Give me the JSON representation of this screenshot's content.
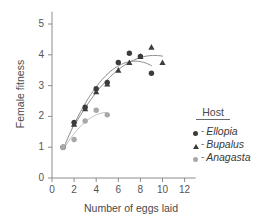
{
  "chart_data": {
    "type": "scatter",
    "title": "",
    "xlabel": "Number of eggs laid",
    "ylabel": "Female fitness",
    "xlim": [
      0,
      13
    ],
    "ylim": [
      0,
      5.4
    ],
    "xticks": [
      0,
      2,
      4,
      6,
      8,
      10,
      12
    ],
    "yticks": [
      0,
      1,
      2,
      3,
      4,
      5
    ],
    "grid": false,
    "legend_position": "right",
    "legend_title": "Host",
    "series": [
      {
        "name": "Ellopia",
        "marker": "circle",
        "color": "#3c3c3c",
        "dash": "-",
        "x": [
          1,
          2,
          3,
          4,
          5,
          6,
          7,
          8,
          9
        ],
        "y": [
          1.0,
          1.8,
          2.3,
          2.9,
          3.1,
          3.75,
          4.05,
          3.95,
          3.4
        ],
        "fit_curve": true
      },
      {
        "name": "Bupalus",
        "marker": "triangle",
        "color": "#3c3c3c",
        "dash": "-",
        "x": [
          2,
          3,
          4,
          5,
          6,
          7,
          8,
          9,
          10
        ],
        "y": [
          1.75,
          2.25,
          2.8,
          3.05,
          3.5,
          3.75,
          3.95,
          4.25,
          3.75
        ],
        "fit_curve": true
      },
      {
        "name": "Anagasta",
        "marker": "circle-light",
        "color": "#a8a8a8",
        "dash": "-",
        "x": [
          1,
          2,
          3,
          4,
          5
        ],
        "y": [
          1.0,
          1.25,
          1.85,
          2.2,
          2.05
        ],
        "fit_curve": true
      }
    ]
  },
  "axis": {
    "xtick_labels": [
      "0",
      "2",
      "4",
      "6",
      "8",
      "10",
      "12"
    ],
    "ytick_labels": [
      "0",
      "1",
      "2",
      "3",
      "4",
      "5"
    ],
    "xlabel": "Number of eggs laid",
    "ylabel": "Female fitness"
  },
  "legend": {
    "title": "Host",
    "entries": [
      {
        "dash": "-",
        "name": "Ellopia"
      },
      {
        "dash": "-",
        "name": "Bupalus"
      },
      {
        "dash": "-",
        "name": "Anagasta"
      }
    ]
  }
}
